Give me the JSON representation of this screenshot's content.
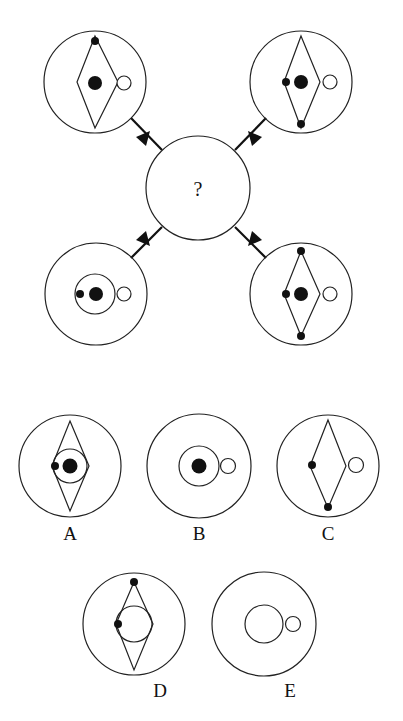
{
  "puzzle": {
    "question_mark": "?",
    "colors": {
      "stroke": "#1a1a1a",
      "fill_dark": "#111111",
      "background": "#ffffff"
    },
    "given_figures": [
      {
        "position": "top-left",
        "outer_circle": true,
        "diamond": true,
        "inner_circle": false,
        "big_dot": true,
        "small_dots": [
          "top"
        ],
        "hollow_circle": true,
        "arrow": "points toward center"
      },
      {
        "position": "top-right",
        "outer_circle": true,
        "diamond": true,
        "inner_circle": false,
        "big_dot": true,
        "small_dots": [
          "left",
          "bottom"
        ],
        "hollow_circle": true,
        "arrow": "points toward center"
      },
      {
        "position": "bottom-left",
        "outer_circle": true,
        "diamond": false,
        "inner_circle": true,
        "big_dot": true,
        "small_dots": [
          "left"
        ],
        "hollow_circle": true,
        "arrow": "points toward center"
      },
      {
        "position": "bottom-right",
        "outer_circle": true,
        "diamond": true,
        "inner_circle": false,
        "big_dot": true,
        "small_dots": [
          "top",
          "left",
          "bottom"
        ],
        "hollow_circle": true,
        "arrow": "points toward center"
      }
    ],
    "options": [
      {
        "label": "A",
        "diamond": true,
        "inner_circle": true,
        "big_dot": true,
        "small_dots": [
          "left"
        ],
        "hollow_circle": false
      },
      {
        "label": "B",
        "diamond": false,
        "inner_circle": true,
        "big_dot": true,
        "small_dots": [],
        "hollow_circle": true
      },
      {
        "label": "C",
        "diamond": true,
        "inner_circle": false,
        "big_dot": false,
        "small_dots": [
          "left",
          "bottom"
        ],
        "hollow_circle": true
      },
      {
        "label": "D",
        "diamond": true,
        "inner_circle": true,
        "big_dot": false,
        "small_dots": [
          "top",
          "left"
        ],
        "hollow_circle": false
      },
      {
        "label": "E",
        "diamond": false,
        "inner_circle": true,
        "big_dot": false,
        "small_dots": [],
        "hollow_circle": true
      }
    ]
  }
}
